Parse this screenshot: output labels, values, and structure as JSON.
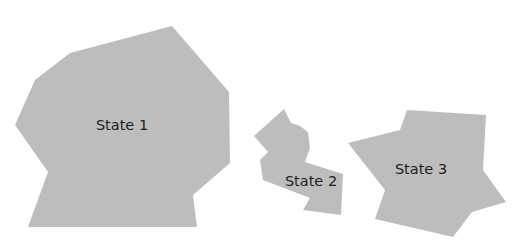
{
  "diagram": {
    "fill_color": "#bdbdbd",
    "text_color": "#1e1e1e",
    "states": [
      {
        "label": "State 1",
        "label_pos": [
          122,
          126
        ],
        "points": "172,26 70,53 35,80 15,125 48,172 28,227 197,227 193,195 230,163 229,92"
      },
      {
        "label": "State 2",
        "label_pos": [
          311,
          182
        ],
        "points": "284,109 291,123 300,126 308,132 310,148 305,162 343,174 341,215 303,210 310,198 263,180 260,160 268,152 254,136"
      },
      {
        "label": "State 3",
        "label_pos": [
          421,
          170
        ],
        "points": "407,110 486,115 483,170 506,202 472,212 453,237 375,219 385,190 348,143 400,130"
      }
    ]
  }
}
